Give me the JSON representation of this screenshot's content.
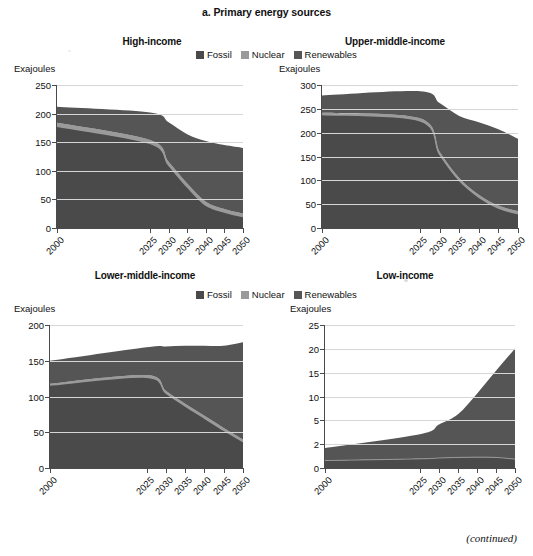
{
  "figure": {
    "title": "a. Primary energy sources",
    "footnote": "(continued)",
    "axis_unit_label": "Exajoules",
    "colors": {
      "fossil": "#4a4a4a",
      "nuclear": "#9a9a9a",
      "renewables": "#555555",
      "gridline": "#d6d6d6",
      "axis": "#4a4a4a",
      "text": "#111111"
    }
  },
  "legend": {
    "entries": [
      {
        "label": "Fossil",
        "color": "#4a4a4a"
      },
      {
        "label": "Nuclear",
        "color": "#9a9a9a"
      },
      {
        "label": "Renewables",
        "color": "#555555"
      }
    ]
  },
  "chart_data": [
    {
      "type": "area",
      "id": "high-income",
      "title": "High-income",
      "ylabel": "Exajoules",
      "xlabel": "",
      "stacked": true,
      "grid": true,
      "legend_position": "top-center",
      "x": [
        2000,
        2025,
        2030,
        2035,
        2040,
        2045,
        2050
      ],
      "xlim": [
        2000,
        2050
      ],
      "ylim": [
        0,
        250
      ],
      "yticks": [
        0,
        50,
        100,
        150,
        200,
        250
      ],
      "xticks": [
        "2000",
        "2025",
        "2030",
        "2035",
        "2040",
        "2045",
        "2050"
      ],
      "series": [
        {
          "name": "Fossil",
          "color": "#4a4a4a",
          "values": [
            178,
            148,
            110,
            72,
            40,
            28,
            20
          ]
        },
        {
          "name": "Nuclear",
          "color": "#9a9a9a",
          "values": [
            6,
            6,
            6,
            6,
            6,
            5,
            5
          ]
        },
        {
          "name": "Renewables",
          "color": "#555555",
          "values": [
            28,
            48,
            69,
            86,
            106,
            112,
            115
          ]
        }
      ],
      "totals": [
        212,
        202,
        185,
        164,
        152,
        145,
        140
      ]
    },
    {
      "type": "area",
      "id": "upper-middle-income",
      "title": "Upper-middle-income",
      "ylabel": "Exajoules",
      "xlabel": "",
      "stacked": true,
      "grid": true,
      "legend_position": "top-center",
      "x": [
        2000,
        2025,
        2030,
        2035,
        2040,
        2045,
        2050
      ],
      "xlim": [
        2000,
        2050
      ],
      "ylim": [
        0,
        300
      ],
      "yticks": [
        0,
        50,
        100,
        150,
        200,
        250,
        300
      ],
      "xticks": [
        "2000",
        "2025",
        "2030",
        "2035",
        "2040",
        "2045",
        "2050"
      ],
      "series": [
        {
          "name": "Fossil",
          "color": "#4a4a4a",
          "values": [
            238,
            225,
            155,
            100,
            65,
            42,
            30
          ]
        },
        {
          "name": "Nuclear",
          "color": "#9a9a9a",
          "values": [
            4,
            5,
            5,
            5,
            5,
            5,
            5
          ]
        },
        {
          "name": "Renewables",
          "color": "#555555",
          "values": [
            36,
            57,
            102,
            130,
            152,
            160,
            152
          ]
        }
      ],
      "totals": [
        278,
        287,
        262,
        235,
        222,
        207,
        187
      ]
    },
    {
      "type": "area",
      "id": "lower-middle-income",
      "title": "Lower-middle-income",
      "ylabel": "Exajoules",
      "xlabel": "",
      "stacked": true,
      "grid": true,
      "legend_position": "top-center",
      "x": [
        2000,
        2025,
        2030,
        2035,
        2040,
        2045,
        2050
      ],
      "xlim": [
        2000,
        2050
      ],
      "ylim": [
        0,
        200
      ],
      "yticks": [
        0,
        50,
        100,
        150,
        200
      ],
      "xticks": [
        "2000",
        "2025",
        "2030",
        "2035",
        "2040",
        "2045",
        "2050"
      ],
      "series": [
        {
          "name": "Fossil",
          "color": "#4a4a4a",
          "values": [
            116,
            127,
            105,
            87,
            70,
            53,
            37
          ]
        },
        {
          "name": "Nuclear",
          "color": "#9a9a9a",
          "values": [
            2,
            3,
            3,
            3,
            3,
            3,
            3
          ]
        },
        {
          "name": "Renewables",
          "color": "#555555",
          "values": [
            32,
            39,
            62,
            81,
            98,
            115,
            136
          ]
        }
      ],
      "totals": [
        150,
        169,
        170,
        171,
        171,
        171,
        176
      ]
    },
    {
      "type": "area",
      "id": "low-income",
      "title": "Low-income",
      "ylabel": "Exajoules",
      "xlabel": "",
      "stacked": true,
      "grid": true,
      "legend_position": "top-center",
      "x": [
        2000,
        2025,
        2030,
        2035,
        2040,
        2045,
        2050
      ],
      "xlim": [
        2000,
        2050
      ],
      "ylim": [
        0,
        25
      ],
      "yticks": [
        0,
        2,
        5,
        10,
        15,
        20,
        25
      ],
      "ytick_spacing": "irregular",
      "xticks": [
        "2000",
        "2025",
        "2030",
        "2035",
        "2040",
        "2045",
        "2050"
      ],
      "series": [
        {
          "name": "Fossil",
          "color": "#4a4a4a",
          "values": [
            1.3,
            1.6,
            1.75,
            1.85,
            1.9,
            1.85,
            1.55
          ]
        },
        {
          "name": "Nuclear",
          "color": "#9a9a9a",
          "values": [
            0,
            0,
            0,
            0,
            0,
            0,
            0
          ]
        },
        {
          "name": "Renewables",
          "color": "#555555",
          "values": [
            2.2,
            4.3,
            5.85,
            7.55,
            11.1,
            15.15,
            19.35
          ]
        }
      ],
      "totals": [
        3.5,
        5.9,
        7.6,
        9.4,
        13.0,
        17.0,
        20.9
      ]
    }
  ]
}
